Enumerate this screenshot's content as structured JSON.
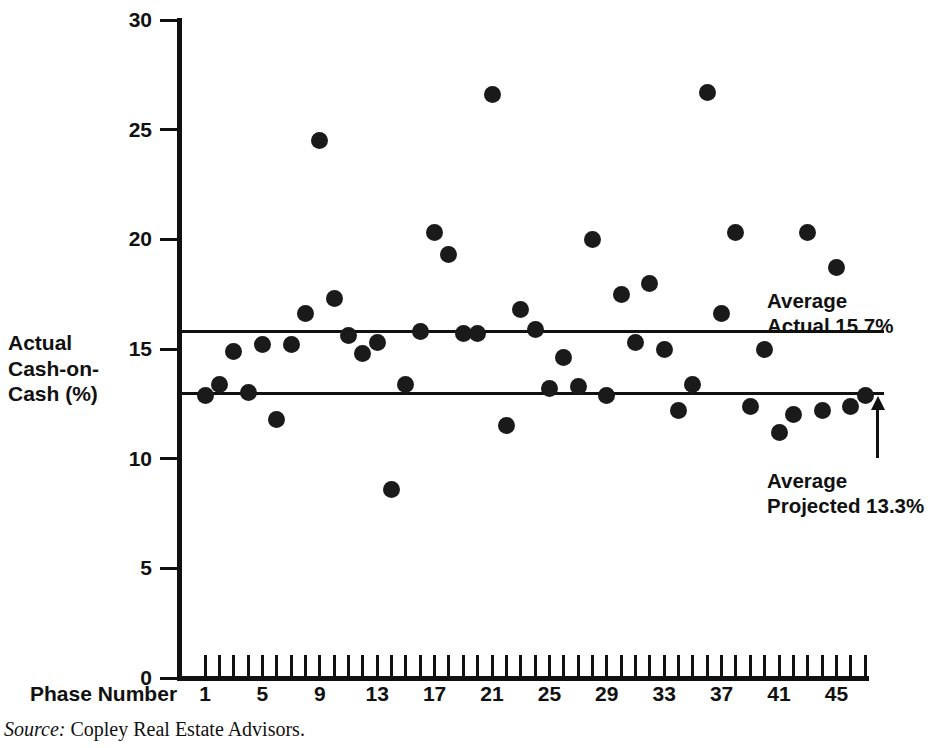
{
  "figure": {
    "source_label": "Source:",
    "source_text": "Copley Real Estate Advisors."
  },
  "axes": {
    "y_title": "Actual\nCash-on-\nCash (%)",
    "x_title": "Phase Number",
    "y_ticks": [
      0,
      5,
      10,
      15,
      20,
      25,
      30
    ],
    "x_tick_labels": [
      1,
      5,
      9,
      13,
      17,
      21,
      25,
      29,
      33,
      37,
      41,
      45
    ]
  },
  "annotations": {
    "average_actual": "Average\nActual 15.7%",
    "average_projected": "Average\nProjected 13.3%"
  },
  "chart_data": {
    "type": "scatter",
    "title": "",
    "xlabel": "Phase Number",
    "ylabel": "Actual Cash-on-Cash (%)",
    "xlim": [
      0,
      48
    ],
    "ylim": [
      0,
      30
    ],
    "grid": false,
    "legend": null,
    "marker": "filled-circle",
    "marker_color": "#1a1a1a",
    "x": [
      1,
      2,
      3,
      4,
      5,
      6,
      7,
      8,
      9,
      10,
      11,
      12,
      13,
      14,
      15,
      16,
      17,
      18,
      19,
      20,
      21,
      22,
      23,
      24,
      25,
      26,
      27,
      28,
      29,
      30,
      31,
      32,
      33,
      34,
      35,
      36,
      37,
      38,
      39,
      40,
      41,
      42,
      43,
      44,
      45,
      46,
      47
    ],
    "y": [
      12.9,
      13.4,
      14.9,
      13.0,
      15.2,
      11.8,
      15.2,
      16.6,
      24.5,
      17.3,
      15.6,
      14.8,
      15.3,
      8.6,
      13.4,
      15.8,
      20.3,
      19.3,
      15.7,
      15.7,
      26.6,
      11.5,
      16.8,
      15.9,
      13.2,
      14.6,
      13.3,
      20.0,
      12.9,
      17.5,
      15.3,
      18.0,
      15.0,
      12.2,
      13.4,
      26.7,
      16.6,
      20.3,
      12.4,
      15.0,
      11.2,
      12.0,
      20.3,
      12.2,
      18.7,
      12.4,
      12.9
    ],
    "reference_lines": [
      {
        "name": "Average Actual",
        "value": 15.7,
        "label": "Average Actual 15.7%"
      },
      {
        "name": "Average Projected",
        "value": 13.3,
        "label": "Average Projected 13.3%"
      }
    ]
  }
}
